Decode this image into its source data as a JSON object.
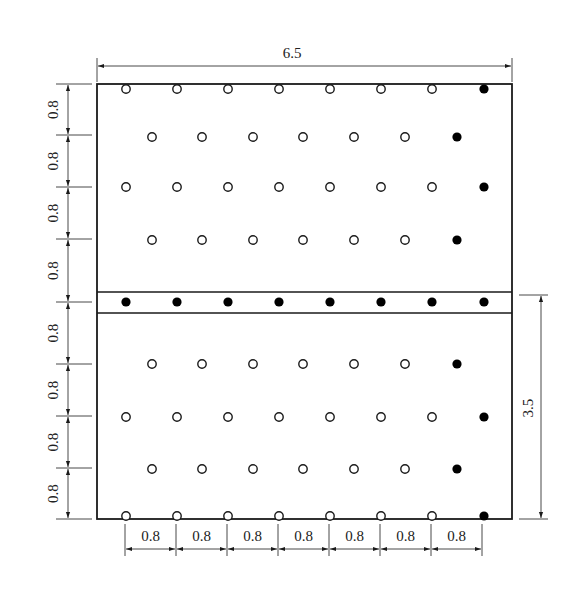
{
  "diagram": {
    "type": "hole layout / grid dimension drawing",
    "colors": {
      "line": "#1a1a1a",
      "hole_empty_fill": "#ffffff",
      "hole_filled": "#000000",
      "background": "#ffffff"
    },
    "dimensions": {
      "top_width": "6.5",
      "right_height": "3.5",
      "left_spacings": [
        "0.8",
        "0.8",
        "0.8",
        "0.8",
        "0.8",
        "0.8",
        "0.8",
        "0.8"
      ],
      "bottom_spacings": [
        "0.8",
        "0.8",
        "0.8",
        "0.8",
        "0.8",
        "0.8",
        "0.8"
      ]
    },
    "legend": {
      "open_circle": "hole-open",
      "filled_circle": "hole-filled"
    },
    "rows": [
      {
        "y": 89,
        "xs": [
          126,
          177,
          228,
          279,
          330,
          381,
          432
        ],
        "filled_xs": [
          484
        ]
      },
      {
        "y": 137,
        "xs": [
          152,
          202,
          253,
          303,
          354,
          405
        ],
        "filled_xs": [
          457
        ]
      },
      {
        "y": 187,
        "xs": [
          126,
          177,
          228,
          279,
          330,
          381,
          432
        ],
        "filled_xs": [
          484
        ]
      },
      {
        "y": 240,
        "xs": [
          152,
          202,
          253,
          303,
          354,
          405
        ],
        "filled_xs": [
          457
        ]
      },
      {
        "y": 302,
        "xs": [],
        "filled_xs": [
          126,
          177,
          228,
          279,
          330,
          381,
          432,
          484
        ]
      },
      {
        "y": 364,
        "xs": [
          152,
          202,
          253,
          303,
          354,
          405
        ],
        "filled_xs": [
          457
        ]
      },
      {
        "y": 417,
        "xs": [
          126,
          177,
          228,
          279,
          330,
          381,
          432
        ],
        "filled_xs": [
          484
        ]
      },
      {
        "y": 469,
        "xs": [
          152,
          202,
          253,
          303,
          354,
          405
        ],
        "filled_xs": [
          457
        ]
      },
      {
        "y": 516,
        "xs": [
          126,
          177,
          228,
          279,
          330,
          381,
          432
        ],
        "filled_xs": [
          484
        ]
      }
    ]
  }
}
